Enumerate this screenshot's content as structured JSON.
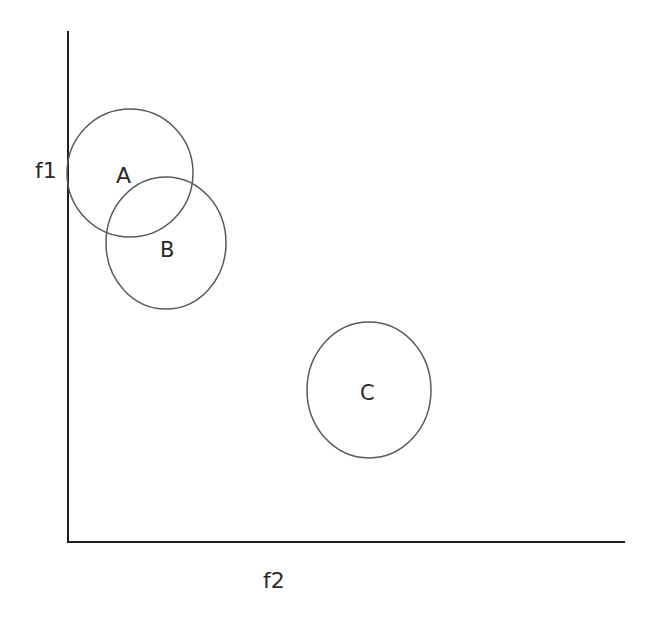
{
  "diagram": {
    "axes": {
      "y_label": "f1",
      "x_label": "f2",
      "color": "#1e1e1e"
    },
    "clusters": [
      {
        "label": "A",
        "cx": 130,
        "cy": 173,
        "rx": 63,
        "ry": 63
      },
      {
        "label": "B",
        "cx": 166,
        "cy": 243,
        "rx": 60,
        "ry": 65
      },
      {
        "label": "C",
        "cx": 369,
        "cy": 390,
        "rx": 62,
        "ry": 68
      }
    ],
    "circle_color": "#555555"
  }
}
